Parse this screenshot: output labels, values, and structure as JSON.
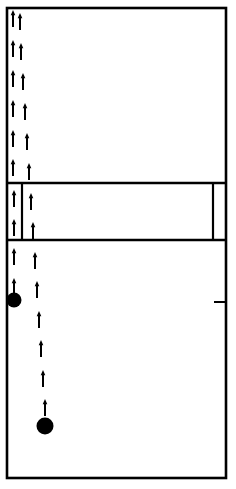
{
  "canvas": {
    "width": 236,
    "height": 489,
    "background": "#ffffff"
  },
  "style": {
    "ink": "#000000",
    "frame_stroke_width": 2.6,
    "divider_stroke_width": 2.2,
    "band_edge_stroke_width": 2.4,
    "tick_stroke_width": 2.0,
    "arrow_stroke_width": 2.0,
    "arrow_head_width": 4.6,
    "arrow_head_height": 5.2
  },
  "frame": {
    "label": "outer-boundary",
    "x": 7,
    "y": 8,
    "width": 219,
    "height": 470
  },
  "band": {
    "label": "middle-band",
    "top_y": 183,
    "bottom_y": 240,
    "divider_x": [
      22,
      213
    ]
  },
  "ticks": [
    {
      "name": "left-edge-tick",
      "x1": 7,
      "y1": 302,
      "x2": 19,
      "y2": 302
    },
    {
      "name": "right-edge-tick",
      "x1": 214,
      "y1": 302,
      "x2": 226,
      "y2": 302
    }
  ],
  "arrows": {
    "description": "Upward-pointing arrow glyphs in two vertical tracks",
    "direction": "up",
    "length": 17,
    "left_track": [
      {
        "x": 13,
        "y_tail": 27,
        "y_tip": 10
      },
      {
        "x": 13,
        "y_tail": 57,
        "y_tip": 40
      },
      {
        "x": 13,
        "y_tail": 87,
        "y_tip": 70
      },
      {
        "x": 13,
        "y_tail": 117,
        "y_tip": 100
      },
      {
        "x": 13,
        "y_tail": 147,
        "y_tip": 130
      },
      {
        "x": 13,
        "y_tail": 176,
        "y_tip": 159
      },
      {
        "x": 14,
        "y_tail": 207,
        "y_tip": 190
      },
      {
        "x": 14,
        "y_tail": 236,
        "y_tip": 219
      },
      {
        "x": 14,
        "y_tail": 265,
        "y_tip": 248
      },
      {
        "x": 14,
        "y_tail": 295,
        "y_tip": 278
      }
    ],
    "right_track": [
      {
        "x": 20,
        "y_tail": 30,
        "y_tip": 13
      },
      {
        "x": 21,
        "y_tail": 60,
        "y_tip": 43
      },
      {
        "x": 23,
        "y_tail": 90,
        "y_tip": 73
      },
      {
        "x": 25,
        "y_tail": 120,
        "y_tip": 103
      },
      {
        "x": 27,
        "y_tail": 150,
        "y_tip": 133
      },
      {
        "x": 29,
        "y_tail": 180,
        "y_tip": 163
      },
      {
        "x": 31,
        "y_tail": 210,
        "y_tip": 193
      },
      {
        "x": 33,
        "y_tail": 239,
        "y_tip": 222
      },
      {
        "x": 35,
        "y_tail": 269,
        "y_tip": 252
      },
      {
        "x": 37,
        "y_tail": 298,
        "y_tip": 281
      },
      {
        "x": 39,
        "y_tail": 328,
        "y_tip": 311
      },
      {
        "x": 41,
        "y_tail": 357,
        "y_tip": 340
      },
      {
        "x": 43,
        "y_tail": 387,
        "y_tip": 370
      },
      {
        "x": 45,
        "y_tail": 416,
        "y_tip": 399
      }
    ]
  },
  "nodes": [
    {
      "name": "node-upper",
      "cx": 14,
      "cy": 300,
      "r": 7.5
    },
    {
      "name": "node-lower",
      "cx": 45,
      "cy": 426,
      "r": 8.5
    }
  ]
}
